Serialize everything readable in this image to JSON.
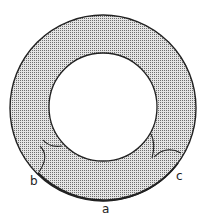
{
  "diagram": {
    "type": "annulus-cross-section",
    "colors": {
      "background": "#ffffff",
      "stroke": "#222222",
      "hatch_dot": "#6e6e6e",
      "hatch_bg": "#e4e4e4"
    },
    "labels": {
      "a": "a",
      "b": "b",
      "c": "c"
    }
  }
}
